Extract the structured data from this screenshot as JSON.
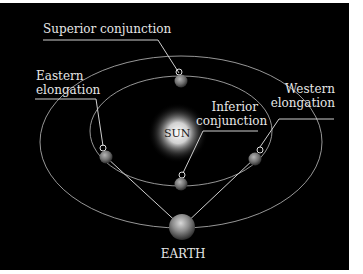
{
  "labels": {
    "superior": "Superior conjunction",
    "eastern_1": "Eastern",
    "eastern_2": "elongation",
    "inferior_1": "Inferior",
    "inferior_2": "conjunction",
    "western_1": "Western",
    "western_2": "elongation",
    "sun": "SUN",
    "earth": "EARTH"
  },
  "colors": {
    "background": "#000000",
    "orbit": "#bdbdbd",
    "text": "#e6e6e6",
    "sun_core": "#ffffff",
    "planet": "#8a8a8a"
  }
}
